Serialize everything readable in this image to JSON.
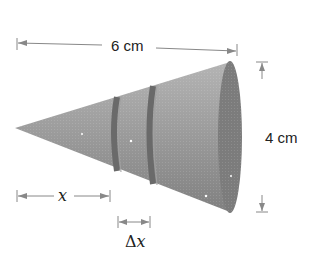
{
  "figure": {
    "type": "cone-diagram",
    "labels": {
      "length": "6 cm",
      "diameter": "4 cm",
      "x": "x",
      "delta_x_symbol": "Δ",
      "delta_x_var": "x"
    },
    "colors": {
      "cone_fill": "#8f8f8f",
      "cone_end": "#777777",
      "band": "#6a6a6a",
      "arrow": "#888888",
      "text": "#222222"
    }
  }
}
